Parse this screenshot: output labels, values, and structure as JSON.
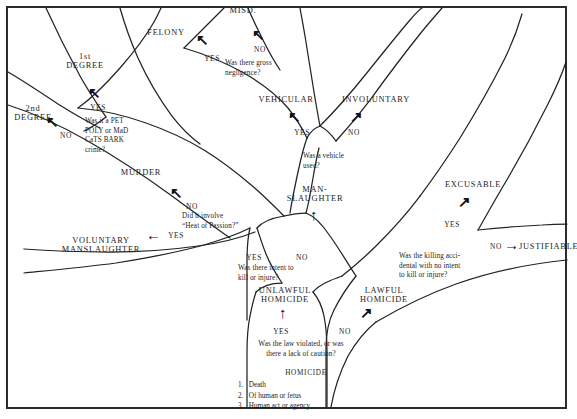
{
  "diagram": {
    "frame_color": "#2b2b2b",
    "ink_color": "#232323",
    "background": "#ffffff"
  },
  "categories": {
    "misdemeanor": "MISD.",
    "felony": "FELONY",
    "first_degree": "1st\nDEGREE",
    "second_degree": "2nd\nDEGREE",
    "murder": "MURDER",
    "vehicular": "VEHICULAR",
    "involuntary": "INVOLUNTARY",
    "manslaughter": "MAN-\nSLAUGHTER",
    "voluntary_manslaughter": "VOLUNTARY\nMANSLAUGHTER",
    "unlawful_homicide": "UNLAWFUL\nHOMICIDE",
    "lawful_homicide": "LAWFUL\nHOMICIDE",
    "excusable": "EXCUSABLE",
    "justifiable": "JUSTIFIABLE"
  },
  "questions": {
    "gross_negligence": "Was there gross\nnegligence?",
    "pet_poly": "Was it a PET\nPOLY or MaD\nCaTS BARK\ncrime?",
    "vehicle_used": "Was a vehicle\nused?",
    "heat_of_passion": "Did it involve\n“Heat of Passion?”",
    "intent_to_kill": "Was there intent to\nkill or injure?",
    "accidental": "Was the killing acci-\ndental with no intent\nto kill or injure?",
    "law_violated": "Was the law violated, or was\nthere a lack of caution?"
  },
  "branch_labels": {
    "yes": "YES",
    "no": "NO"
  },
  "homicide_definition": {
    "title": "HOMICIDE",
    "items": [
      "1.   Death",
      "2.   Of human or fetus",
      "3.   Human act or agency"
    ]
  },
  "arrow_glyphs": {
    "up_left": "↖",
    "up_right": "↗",
    "up": "↑",
    "left": "←",
    "right": "→"
  }
}
